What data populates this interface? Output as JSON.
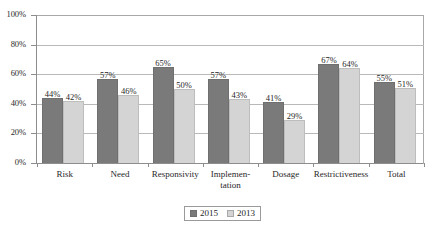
{
  "chart_data": {
    "type": "bar",
    "title": "",
    "subtitle": "",
    "xlabel": "",
    "ylabel": "",
    "ylim": [
      0,
      100
    ],
    "ytick_labels": [
      "0%",
      "20%",
      "40%",
      "60%",
      "80%",
      "100%"
    ],
    "ytick_values": [
      0,
      20,
      40,
      60,
      80,
      100
    ],
    "grid": true,
    "legend_position": "bottom-center",
    "value_suffix": "%",
    "categories": [
      "Risk",
      "Need",
      "Responsivity",
      "Implemen-\ntation",
      "Dosage",
      "Restrictiveness",
      "Total"
    ],
    "series": [
      {
        "name": "2015",
        "color": "#7a7a7a",
        "values": [
          44,
          57,
          65,
          57,
          41,
          67,
          55
        ],
        "labels": [
          "44%",
          "57%",
          "65%",
          "57%",
          "41%",
          "67%",
          "55%"
        ]
      },
      {
        "name": "2013",
        "color": "#d4d4d4",
        "values": [
          42,
          46,
          50,
          43,
          29,
          64,
          51
        ],
        "labels": [
          "42%",
          "46%",
          "50%",
          "43%",
          "29%",
          "64%",
          "51%"
        ]
      }
    ]
  }
}
